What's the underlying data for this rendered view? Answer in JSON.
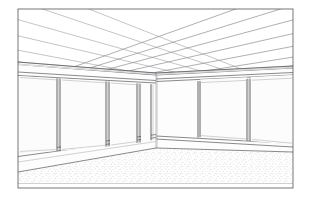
{
  "image": {
    "title": "Interior perspective line drawing of an empty office room",
    "subject": "empty corner office interior",
    "style": "black and white technical line drawing / CAD perspective render",
    "background_color": "#ffffff",
    "line_color": "#3a3a3a",
    "width": 311,
    "height": 203
  },
  "frame": {
    "name": "image-border",
    "left": 18,
    "top": 9,
    "right": 293,
    "bottom": 188,
    "stroke": "#555555"
  },
  "scene": {
    "vanishing_corner_x": 156,
    "ceiling_line_y": 73,
    "floor_corner_y": 148,
    "elements": [
      {
        "name": "suspended-ceiling-grid",
        "description": "grid of rectangular acoustic ceiling tiles converging in two-point perspective"
      },
      {
        "name": "left-wall",
        "description": "wall at left receding to left vanishing point"
      },
      {
        "name": "right-wall",
        "description": "wall at right receding to right vanishing point"
      },
      {
        "name": "inside-corner",
        "description": "vertical line where the two walls meet"
      },
      {
        "name": "floor",
        "description": "speckled carpet floor plane"
      }
    ]
  },
  "ceiling": {
    "name": "ceiling-tile-grid",
    "tile_rows": 6,
    "tile_cols": 8,
    "grid_color": "#6e6e76",
    "perimeter_trim": true
  },
  "left_wall": {
    "name": "left-wall-window-bank",
    "panel_count": 4,
    "panels": [
      {
        "name": "window-panel-l1",
        "position": "far-left"
      },
      {
        "name": "window-panel-l2",
        "position": "left-mid"
      },
      {
        "name": "window-panel-l3",
        "position": "right-mid"
      },
      {
        "name": "window-panel-l4",
        "position": "narrow-near-corner"
      }
    ],
    "has_head_rail": true,
    "has_sill_rail": true,
    "mullion_color": "#2f2f2f"
  },
  "right_wall": {
    "name": "right-wall-window-bank",
    "panel_count": 2,
    "panels": [
      {
        "name": "window-panel-r1",
        "position": "near-corner"
      },
      {
        "name": "window-panel-r2",
        "position": "far-right"
      }
    ],
    "has_head_rail": true,
    "has_sill_rail": true,
    "mullion_color": "#2f2f2f"
  },
  "floor": {
    "name": "carpet-floor",
    "texture": "stipple speckle",
    "speckle_color": "#8d8d95",
    "base_color": "#ffffff"
  }
}
